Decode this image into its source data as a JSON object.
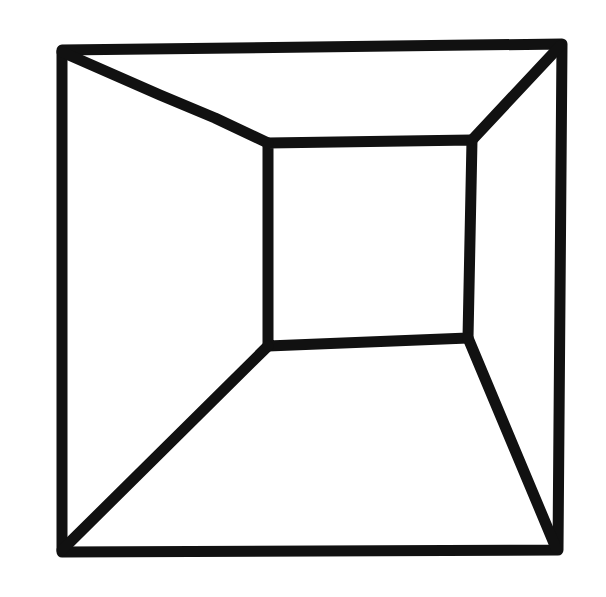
{
  "drawing": {
    "subject": "room-in-perspective line drawing",
    "stroke_color": "#111111",
    "background_color": "#ffffff",
    "stroke_width": 11,
    "outer_square": [
      [
        62,
        50
      ],
      [
        562,
        44
      ],
      [
        558,
        550
      ],
      [
        62,
        552
      ]
    ],
    "inner_square": [
      [
        268,
        143
      ],
      [
        472,
        140
      ],
      [
        468,
        338
      ],
      [
        268,
        346
      ]
    ],
    "connectors": [
      [
        [
          62,
          52
        ],
        [
          160,
          95
        ],
        [
          215,
          118
        ],
        [
          268,
          143
        ]
      ],
      [
        [
          560,
          46
        ],
        [
          472,
          140
        ]
      ],
      [
        [
          62,
          550
        ],
        [
          268,
          346
        ]
      ],
      [
        [
          556,
          548
        ],
        [
          468,
          338
        ]
      ]
    ]
  }
}
